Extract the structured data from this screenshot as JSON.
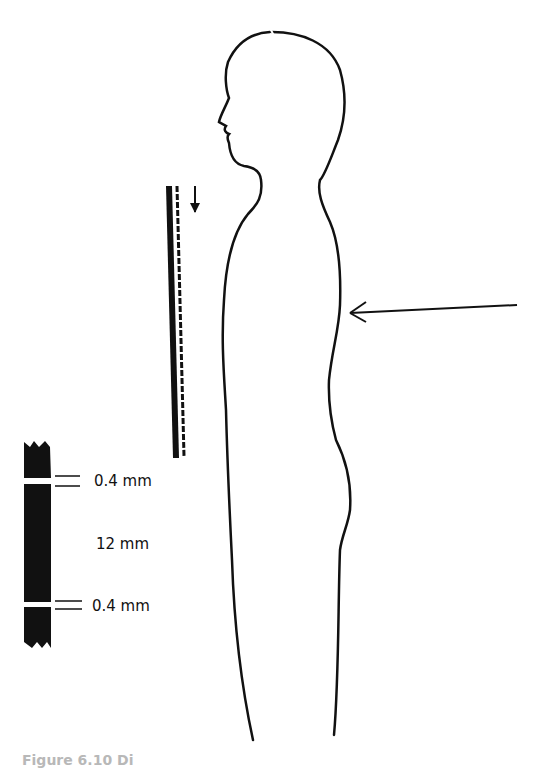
{
  "figure": {
    "caption": "Figure 6.10  Di",
    "colors": {
      "ink": "#111111",
      "background": "#ffffff",
      "caption": "#b8b8b8"
    }
  },
  "film_strip": {
    "labels": {
      "top_gap": "0.4 mm",
      "middle": "12 mm",
      "bottom_gap": "0.4 mm"
    }
  },
  "elements": {
    "body_outline": "human-profile-outline",
    "beam_arrow": "arrow-left-icon",
    "grid_arrow": "arrow-down-icon",
    "grid_bars": "moving-grid-bars"
  }
}
